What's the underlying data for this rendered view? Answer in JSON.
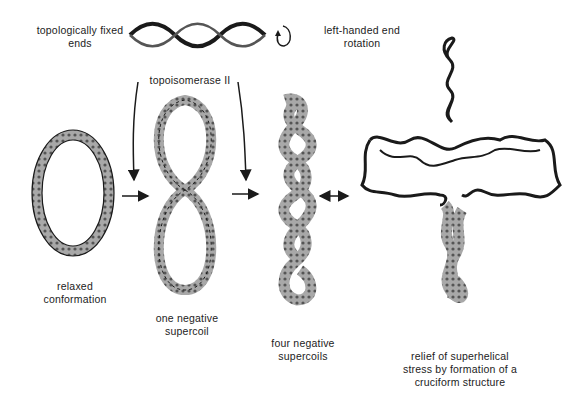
{
  "figure": {
    "labels": {
      "fixed_ends_line1": "topologically  fixed",
      "fixed_ends_line2": "ends",
      "rotation_line1": "left-handed end",
      "rotation_line2": "rotation",
      "enzyme": "topoisomerase  II",
      "relaxed_line1": "relaxed",
      "relaxed_line2": "conformation",
      "one_neg_line1": "one  negative",
      "one_neg_line2": "supercoil",
      "four_neg_line1": "four  negative",
      "four_neg_line2": "supercoils",
      "relief_line1": "relief  of  superhelical",
      "relief_line2": "stress  by  formation  of  a",
      "relief_line3": "cruciform   structure"
    },
    "stages": [
      "relaxed conformation",
      "one negative supercoil",
      "four negative supercoils",
      "cruciform structure"
    ],
    "colors": {
      "ink": "#1a1a1a",
      "fill": "#9a9a9a",
      "background": "#ffffff"
    }
  }
}
